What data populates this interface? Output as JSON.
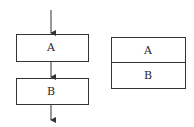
{
  "diagram": {
    "sequential_flowchart": {
      "boxes": [
        {
          "label": "A"
        },
        {
          "label": "B"
        }
      ],
      "arrows": [
        "entry-arrow",
        "a-to-b-arrow",
        "exit-arrow"
      ]
    },
    "nested_structure": {
      "rows": [
        {
          "label": "A"
        },
        {
          "label": "B"
        }
      ]
    },
    "colors": {
      "stroke": "#333333",
      "text": "#2a2a2a",
      "background": "#ffffff"
    }
  }
}
